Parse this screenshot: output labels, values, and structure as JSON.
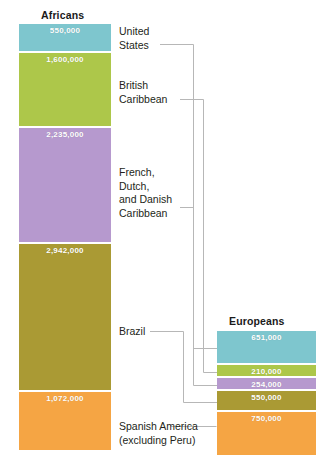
{
  "chart_data": {
    "type": "bar",
    "title": "",
    "orientation": "vertical-stacked",
    "categories": [
      "United States",
      "British Caribbean",
      "French, Dutch, and Danish Caribbean",
      "Brazil",
      "Spanish America (excluding Peru)"
    ],
    "series": [
      {
        "name": "Africans",
        "values": [
          550000,
          1600000,
          2235000,
          2942000,
          1072000
        ],
        "value_labels": [
          "550,000",
          "1,600,000",
          "2,235,000",
          "2,942,000",
          "1,072,000"
        ]
      },
      {
        "name": "Europeans",
        "values": [
          651000,
          210000,
          254000,
          550000,
          750000
        ],
        "value_labels": [
          "651,000",
          "210,000",
          "254,000",
          "550,000",
          "750,000"
        ]
      }
    ],
    "colors": [
      "#7ec6ce",
      "#adc74a",
      "#b699ce",
      "#aa9a34",
      "#f5a544"
    ],
    "grid": false,
    "legend": "none",
    "xlabel": "",
    "ylabel": ""
  },
  "columns": {
    "africans": {
      "title": "Africans",
      "bands": [
        {
          "label": "550,000",
          "color": "#7ec6ce",
          "height": 29
        },
        {
          "label": "1,600,000",
          "color": "#adc74a",
          "height": 75
        },
        {
          "label": "2,235,000",
          "color": "#b699ce",
          "height": 116
        },
        {
          "label": "2,942,000",
          "color": "#aa9a34",
          "height": 148
        },
        {
          "label": "1,072,000",
          "color": "#f5a544",
          "height": 58
        }
      ]
    },
    "europeans": {
      "title": "Europeans",
      "bands": [
        {
          "label": "651,000",
          "color": "#7ec6ce",
          "height": 34
        },
        {
          "label": "210,000",
          "color": "#adc74a",
          "height": 13
        },
        {
          "label": "254,000",
          "color": "#b699ce",
          "height": 13
        },
        {
          "label": "550,000",
          "color": "#aa9a34",
          "height": 21
        },
        {
          "label": "750,000",
          "color": "#f5a544",
          "height": 43
        }
      ]
    }
  },
  "labels": {
    "united_states": "United\nStates",
    "british_caribbean": "British\nCaribbean",
    "french_caribbean": "French,\nDutch,\nand Danish\nCaribbean",
    "brazil": "Brazil",
    "spanish_america": "Spanish America\n(excluding Peru)"
  }
}
